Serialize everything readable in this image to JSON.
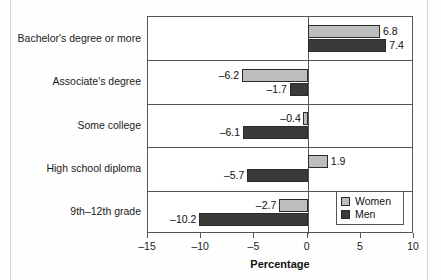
{
  "chart_data": {
    "type": "bar",
    "orientation": "horizontal",
    "title": "",
    "xlabel": "Percentage",
    "ylabel": "",
    "xlim": [
      -15,
      10
    ],
    "xticks": [
      "-15",
      "-10",
      "-5",
      "0",
      "5",
      "10"
    ],
    "xtick_values": [
      -15,
      -10,
      -5,
      0,
      5,
      10
    ],
    "grid": false,
    "legend_position": "bottom-right",
    "categories": [
      "Bachelor's degree or more",
      "Associate's degree",
      "Some college",
      "High school diploma",
      "9th–12th grade"
    ],
    "series": [
      {
        "name": "Women",
        "color": "#bdbdbd",
        "values": [
          6.8,
          -6.2,
          -0.4,
          1.9,
          -2.7
        ],
        "labels": [
          "6.8",
          "–6.2",
          "–0.4",
          "1.9",
          "–2.7"
        ]
      },
      {
        "name": "Men",
        "color": "#3a3a3a",
        "values": [
          7.4,
          -1.7,
          -6.1,
          -5.7,
          -10.2
        ],
        "labels": [
          "7.4",
          "–1.7",
          "–6.1",
          "–5.7",
          "–10.2"
        ]
      }
    ]
  },
  "legend": {
    "items": [
      {
        "label": "Women",
        "color": "#bdbdbd"
      },
      {
        "label": "Men",
        "color": "#3a3a3a"
      }
    ]
  },
  "axis": {
    "x_title": "Percentage"
  }
}
